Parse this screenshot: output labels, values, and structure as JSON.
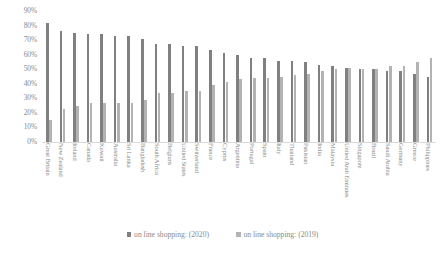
{
  "chart_data": {
    "type": "bar",
    "title": "",
    "xlabel": "",
    "ylabel": "",
    "ylim": [
      0,
      90
    ],
    "grid": false,
    "legend_position": "bottom",
    "y_ticks": [
      "90%",
      "80%",
      "70%",
      "60%",
      "50%",
      "40%",
      "30%",
      "20%",
      "10%",
      "0%"
    ],
    "y_tick_values": [
      90,
      80,
      70,
      60,
      50,
      40,
      30,
      20,
      10,
      0
    ],
    "categories": [
      "Great Britain",
      "New Zealand",
      "Ireland",
      "Canada",
      "Kuwait",
      "Australia",
      "Sri Lanka",
      "Bangladesh",
      "South Africa",
      "Belgium",
      "United States",
      "Switzerland",
      "France",
      "Cyprus",
      "Argentina",
      "Portugal",
      "Spain",
      "Italy",
      "Thailand",
      "Pakistan",
      "India",
      "Malaysia",
      "United Arab Emirates",
      "Singapore",
      "Brazil",
      "Saudi Arabia",
      "Germany",
      "Greece",
      "Philippines"
    ],
    "series": [
      {
        "name": "on line shopping: (2020)",
        "color": "#808080",
        "values": [
          82,
          76,
          75,
          74,
          74,
          73,
          73,
          71,
          67,
          67,
          66,
          66,
          63,
          61,
          60,
          58,
          58,
          56,
          56,
          55,
          53,
          52,
          51,
          50,
          50,
          49,
          49,
          47,
          45
        ]
      },
      {
        "name": "on line shopping: (2019)",
        "color": "#b3b3b3",
        "values": [
          15,
          23,
          25,
          27,
          27,
          27,
          27,
          29,
          34,
          34,
          35,
          35,
          39,
          41,
          43,
          44,
          44,
          45,
          46,
          47,
          49,
          50,
          51,
          50,
          50,
          52,
          52,
          55,
          58
        ]
      }
    ]
  },
  "legend": {
    "items": [
      {
        "label": "on line shopping: (2020)",
        "swatch": "s2020"
      },
      {
        "label": "on line shopping: (2019)",
        "swatch": "s2019"
      }
    ]
  },
  "colors": {
    "series_2020": "#808080",
    "series_2019": "#b3b3b3",
    "text": "#8a8a8a",
    "background": "#ffffff"
  }
}
